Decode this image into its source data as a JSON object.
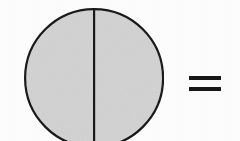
{
  "figure": {
    "kind": "fraction-diagram",
    "background_color": "#fefefe",
    "shapes": {
      "circle": {
        "name": "whole-circle",
        "fill_color": "#d2d2d2",
        "stroke_color": "#1a1a1a",
        "stroke_width": 2.2,
        "center_x": 94,
        "center_y": 78,
        "radius": 69,
        "parts_total": 2,
        "parts_shaded": 2
      },
      "divider": {
        "name": "vertical-diameter-line",
        "orientation": "vertical",
        "stroke_color": "#1a1a1a",
        "stroke_width": 2.2,
        "x": 94,
        "y_start": 9,
        "y_end": 147
      },
      "equals": {
        "name": "equals-sign",
        "symbol": "=",
        "color": "#171717",
        "bar_count": 2,
        "bar_width": 32,
        "bar_height": 4,
        "x": 189,
        "y": 74
      }
    }
  }
}
